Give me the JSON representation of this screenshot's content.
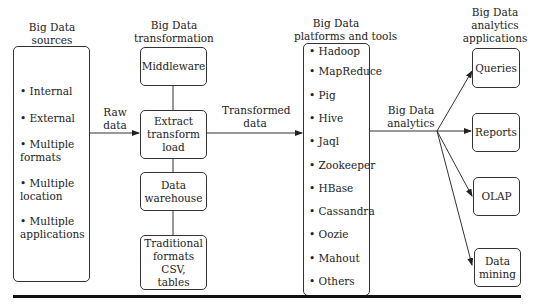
{
  "columns": {
    "sources": {
      "title": [
        "Big Data",
        "sources"
      ],
      "items": [
        "Internal",
        "External",
        "Multiple formats",
        "Multiple location",
        "Multiple applications"
      ]
    },
    "transformation": {
      "title": [
        "Big Data",
        "transformation"
      ],
      "boxes": [
        "Middleware",
        "Extract transform load",
        "Data warehouse",
        "Traditional formats CSV, tables"
      ]
    },
    "platforms": {
      "title": [
        "Big Data",
        "platforms and tools"
      ],
      "items": [
        "Hadoop",
        "MapReduce",
        "Pig",
        "Hive",
        "Jaql",
        "Zookeeper",
        "HBase",
        "Cassandra",
        "Oozie",
        "Mahout",
        "Others"
      ]
    },
    "applications": {
      "title": [
        "Big Data",
        "analytics",
        "applications"
      ],
      "boxes": [
        "Queries",
        "Reports",
        "OLAP",
        "Data mining"
      ]
    }
  },
  "edges": {
    "raw_data": [
      "Raw",
      "data"
    ],
    "transformed_data": [
      "Transformed",
      "data"
    ],
    "analytics": [
      "Big Data",
      "analytics"
    ]
  },
  "bullet": "•"
}
